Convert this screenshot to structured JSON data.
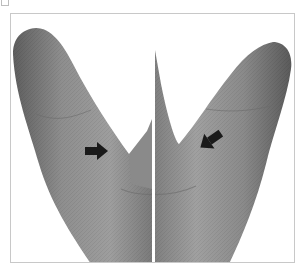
{
  "figure": {
    "panel_label": "",
    "arrows": [
      {
        "id": "left-arrow",
        "direction": "right",
        "color": "#1a1a1a"
      },
      {
        "id": "right-arrow",
        "direction": "down-left",
        "color": "#1a1a1a"
      }
    ],
    "colors": {
      "skin_dark": "#5a5a5a",
      "skin_mid": "#8c8c8c",
      "skin_light": "#a8a8a8",
      "frame_border": "#c8c8c8",
      "divider": "#ffffff",
      "background": "#ffffff"
    }
  }
}
